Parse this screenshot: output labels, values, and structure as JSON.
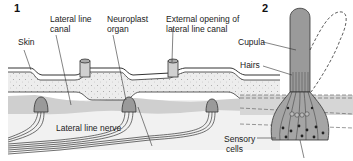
{
  "panels": [
    {
      "number": "1",
      "description": "Cross-section of lateral line canal in skin"
    },
    {
      "number": "2",
      "description": "Neuromast with cupula deflecting"
    }
  ],
  "labels": {
    "skin": "Skin",
    "lateral_line_canal_1": "Lateral line",
    "lateral_line_canal_2": "canal",
    "neuroplast_1": "Neuroplast",
    "neuroplast_2": "organ",
    "external_opening_1": "External opening of",
    "external_opening_2": "lateral line canal",
    "lateral_line_nerve": "Lateral line nerve",
    "cupula": "Cupula",
    "hairs": "Hairs",
    "sensory_1": "Sensory",
    "sensory_2": "cells"
  },
  "colors": {
    "skin": "#e8e8e8",
    "canal": "#c8c8c8",
    "tissue": "#d6d6d6",
    "cupula": "#9a9a9a",
    "outline": "#333333",
    "bg": "#ffffff"
  }
}
